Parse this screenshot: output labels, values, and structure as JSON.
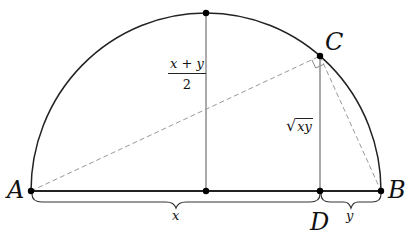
{
  "figure": {
    "points": {
      "A": {
        "label": "A"
      },
      "B": {
        "label": "B"
      },
      "C": {
        "label": "C"
      },
      "D": {
        "label": "D"
      }
    },
    "segment_labels": {
      "x": "x",
      "y": "y"
    },
    "arithmetic_mean": {
      "numerator": "x + y",
      "denominator": "2"
    },
    "geometric_mean": {
      "radical": "√",
      "argument": "xy"
    }
  }
}
